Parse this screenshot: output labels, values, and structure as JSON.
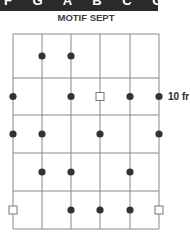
{
  "header": {
    "band_text": "F G A B C G D E /",
    "title": "MOTIF SEPT"
  },
  "fretboard": {
    "columns_x": [
      13,
      42,
      71,
      100,
      130,
      159
    ],
    "rows_y": [
      34,
      78,
      115,
      153,
      191,
      229
    ],
    "line_color": "#8a8a8a",
    "dot_color": "#333333",
    "fret_label": "10 fr",
    "fret_label_row": 1,
    "markers": [
      {
        "row": 0,
        "col": 1,
        "type": "dot"
      },
      {
        "row": 0,
        "col": 2,
        "type": "dot"
      },
      {
        "row": 1,
        "col": 0,
        "type": "dot"
      },
      {
        "row": 1,
        "col": 2,
        "type": "dot"
      },
      {
        "row": 1,
        "col": 3,
        "type": "square"
      },
      {
        "row": 1,
        "col": 4,
        "type": "dot"
      },
      {
        "row": 1,
        "col": 5,
        "type": "dot"
      },
      {
        "row": 2,
        "col": 0,
        "type": "dot"
      },
      {
        "row": 2,
        "col": 1,
        "type": "dot"
      },
      {
        "row": 2,
        "col": 3,
        "type": "dot"
      },
      {
        "row": 2,
        "col": 5,
        "type": "dot"
      },
      {
        "row": 3,
        "col": 1,
        "type": "dot"
      },
      {
        "row": 3,
        "col": 2,
        "type": "dot"
      },
      {
        "row": 3,
        "col": 4,
        "type": "dot"
      },
      {
        "row": 4,
        "col": 0,
        "type": "square"
      },
      {
        "row": 4,
        "col": 2,
        "type": "dot"
      },
      {
        "row": 4,
        "col": 3,
        "type": "dot"
      },
      {
        "row": 4,
        "col": 4,
        "type": "dot"
      },
      {
        "row": 4,
        "col": 5,
        "type": "square"
      }
    ]
  }
}
